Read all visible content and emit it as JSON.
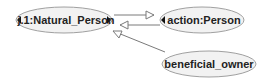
{
  "diagram": {
    "nodes": [
      {
        "id": "natural_person",
        "label": "j.1:Natural_Person"
      },
      {
        "id": "action_person",
        "label": "action:Person"
      },
      {
        "id": "beneficial_owner",
        "label": "beneficial_owner"
      }
    ],
    "edges": [
      {
        "from": "natural_person",
        "to": "action_person",
        "arrow": "hollow-triangle"
      },
      {
        "from": "action_person",
        "to": "natural_person",
        "arrow": "hollow-triangle"
      },
      {
        "from": "beneficial_owner",
        "to": "natural_person",
        "arrow": "hollow-triangle"
      }
    ],
    "colors": {
      "node_fill": "#f2f2f2",
      "node_stroke": "#a0a0a0",
      "edge": "#7a7a7a",
      "marker": "#111111"
    }
  }
}
